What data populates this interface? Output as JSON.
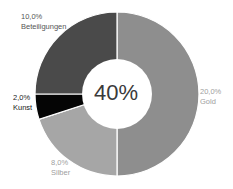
{
  "chart_data": {
    "type": "pie",
    "variant": "donut",
    "title": "",
    "center_label": "40%",
    "total_percent": 40.0,
    "slices": [
      {
        "label": "Gold",
        "value": 20.0,
        "value_label": "20,0%",
        "color": "#8e8e8e",
        "label_color": "#a0a0a0"
      },
      {
        "label": "Silber",
        "value": 8.0,
        "value_label": "8,0%",
        "color": "#a6a6a6",
        "label_color": "#a0a0a0"
      },
      {
        "label": "Kunst",
        "value": 2.0,
        "value_label": "2,0%",
        "color": "#050505",
        "label_color": "#333333"
      },
      {
        "label": "Beteiligungen",
        "value": 10.0,
        "value_label": "10,0%",
        "color": "#4a4a4a",
        "label_color": "#555555"
      }
    ],
    "start_angle_deg": 0,
    "direction": "clockwise"
  },
  "labels": {
    "gold": {
      "value": "20,0%",
      "name": "Gold"
    },
    "silber": {
      "value": "8,0%",
      "name": "Silber"
    },
    "kunst": {
      "value": "2,0%",
      "name": "Kunst"
    },
    "beteiligungen": {
      "value": "10,0%",
      "name": "Beteiligungen"
    }
  },
  "center": {
    "text": "40%"
  }
}
